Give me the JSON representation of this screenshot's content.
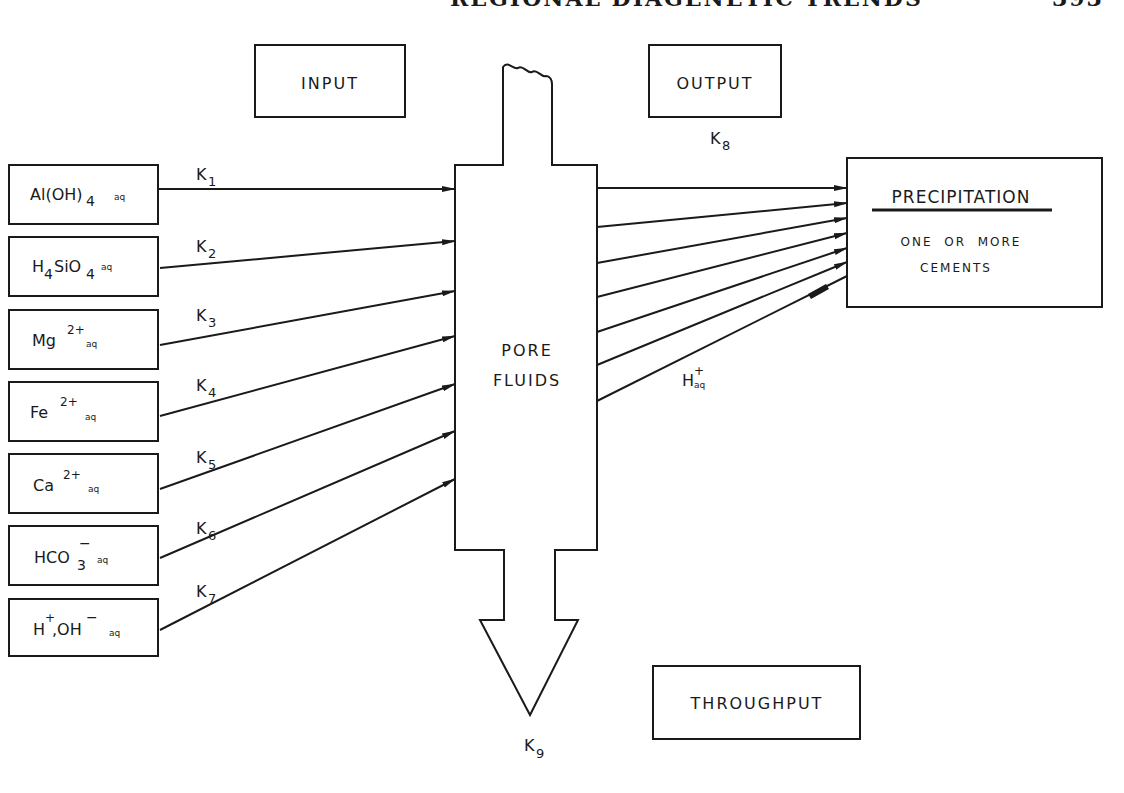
{
  "page_header": {
    "running_title": "REGIONAL DIAGENETIC TRENDS",
    "page_number": "393"
  },
  "diagram": {
    "title_labels": {
      "input": "INPUT",
      "output": "OUTPUT",
      "throughput": "THROUGHPUT"
    },
    "central_node": {
      "line1": "PORE",
      "line2": "FLUIDS"
    },
    "input_species": [
      {
        "base": "Al(OH)",
        "sub": "4",
        "sup": "",
        "aq": "aq",
        "rate": "K",
        "rate_sub": "1"
      },
      {
        "base": "H",
        "sub": "4",
        "mid": "SiO",
        "sub2": "4",
        "aq": "aq",
        "rate": "K",
        "rate_sub": "2"
      },
      {
        "base": "Mg",
        "sup": "2+",
        "aq": "aq",
        "rate": "K",
        "rate_sub": "3"
      },
      {
        "base": "Fe",
        "sup": "2+",
        "aq": "aq",
        "rate": "K",
        "rate_sub": "4"
      },
      {
        "base": "Ca",
        "sup": "2+",
        "aq": "aq",
        "rate": "K",
        "rate_sub": "5"
      },
      {
        "base": "HCO",
        "sub": "3",
        "sup": "−",
        "aq": "aq",
        "rate": "K",
        "rate_sub": "6"
      },
      {
        "base": "H",
        "sup": "+",
        "mid": ",OH",
        "sup2": "−",
        "aq": "aq",
        "rate": "K",
        "rate_sub": "7"
      }
    ],
    "output_rate": {
      "label": "K",
      "sub": "8"
    },
    "throughput_rate": {
      "label": "K",
      "sub": "9"
    },
    "output_byproduct": {
      "base": "H",
      "sup": "+",
      "sub": "aq"
    },
    "precipitation": {
      "title": "PRECIPITATION",
      "line1": "ONE  OR  MORE",
      "line2": "CEMENTS"
    },
    "colors": {
      "ink": "#1a1a1a",
      "background": "#ffffff"
    }
  }
}
